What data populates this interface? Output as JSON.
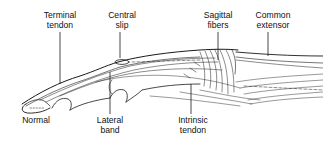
{
  "diagram": {
    "stroke_color": "#1a1a1a",
    "background": "#ffffff",
    "labels_top": [
      {
        "id": "terminal-tendon",
        "line1": "Terminal",
        "line2": "tendon"
      },
      {
        "id": "central-slip",
        "line1": "Central",
        "line2": "slip"
      },
      {
        "id": "sagittal-fibers",
        "line1": "Sagittal",
        "line2": "fibers"
      },
      {
        "id": "common-extensor",
        "line1": "Common",
        "line2": "extensor"
      }
    ],
    "labels_bottom": [
      {
        "id": "normal",
        "line1": "Normal",
        "line2": ""
      },
      {
        "id": "lateral-band",
        "line1": "Lateral",
        "line2": "band"
      },
      {
        "id": "intrinsic-tendon",
        "line1": "Intrinsic",
        "line2": "tendon"
      }
    ]
  }
}
